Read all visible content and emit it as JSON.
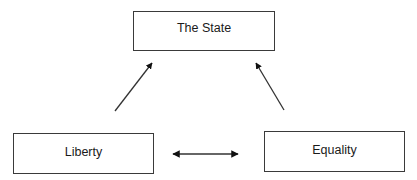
{
  "diagram": {
    "nodes": [
      {
        "id": "state",
        "label": "The State"
      },
      {
        "id": "liberty",
        "label": "Liberty"
      },
      {
        "id": "equality",
        "label": "Equality"
      }
    ],
    "edges": [
      {
        "from": "liberty",
        "to": "state",
        "type": "directed"
      },
      {
        "from": "equality",
        "to": "state",
        "type": "directed"
      },
      {
        "from": "liberty",
        "to": "equality",
        "type": "bidirectional"
      }
    ]
  }
}
